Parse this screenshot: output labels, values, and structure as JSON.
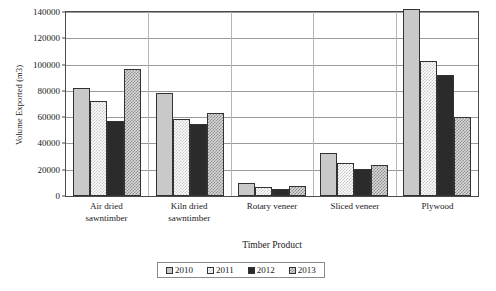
{
  "chart_data": {
    "type": "bar",
    "title": "",
    "xlabel": "Timber Product",
    "ylabel": "Volume Exported (m3)",
    "ylim": [
      0,
      140000
    ],
    "ytick_values": [
      0,
      20000,
      40000,
      60000,
      80000,
      100000,
      120000,
      140000
    ],
    "ytick_labels": [
      "0",
      "20000",
      "40000",
      "60000",
      "80000",
      "100000",
      "120000",
      "140000"
    ],
    "grid": true,
    "legend_position": "bottom",
    "categories": [
      "Air dried sawntimber",
      "Kiln dried sawntimber",
      "Rotary veneer",
      "Sliced veneer",
      "Plywood"
    ],
    "category_lines": [
      [
        "Air dried",
        "sawntimber"
      ],
      [
        "Kiln dried",
        "sawntimber"
      ],
      [
        "Rotary veneer"
      ],
      [
        "Sliced veneer"
      ],
      [
        "Plywood"
      ]
    ],
    "series": [
      {
        "name": "2010",
        "values": [
          82000,
          78500,
          10000,
          32500,
          142000
        ]
      },
      {
        "name": "2011",
        "values": [
          72000,
          58500,
          7000,
          25000,
          103000
        ]
      },
      {
        "name": "2012",
        "values": [
          57000,
          55000,
          5500,
          20500,
          92000
        ]
      },
      {
        "name": "2013",
        "values": [
          97000,
          63500,
          7500,
          23500,
          60500
        ]
      }
    ]
  },
  "legend": {
    "items": [
      {
        "label": "2010"
      },
      {
        "label": "2011"
      },
      {
        "label": "2012"
      },
      {
        "label": "2013"
      }
    ]
  }
}
